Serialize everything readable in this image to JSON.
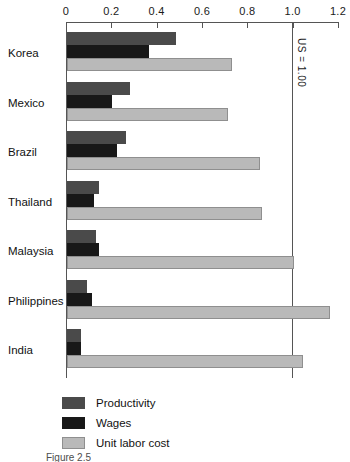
{
  "chart_data": {
    "type": "bar",
    "orientation": "horizontal",
    "title": "",
    "xlabel": "",
    "ylabel": "",
    "xlim": [
      0,
      1.2
    ],
    "grid": false,
    "legend_position": "bottom-left",
    "tick_labels": [
      "0",
      "0.2",
      "0.4",
      "0.6",
      "0.8",
      "1.0",
      "1.2"
    ],
    "tick_values": [
      0,
      0.2,
      0.4,
      0.6,
      0.8,
      1.0,
      1.2
    ],
    "categories": [
      "Korea",
      "Mexico",
      "Brazil",
      "Thailand",
      "Malaysia",
      "Philippines",
      "India"
    ],
    "series": [
      {
        "name": "Productivity",
        "color": "#4a4a4a",
        "values": [
          0.48,
          0.28,
          0.26,
          0.14,
          0.13,
          0.09,
          0.06
        ]
      },
      {
        "name": "Wages",
        "color": "#181818",
        "values": [
          0.36,
          0.2,
          0.22,
          0.12,
          0.14,
          0.11,
          0.06
        ]
      },
      {
        "name": "Unit labor cost",
        "color": "#b9b9b9",
        "values": [
          0.73,
          0.71,
          0.85,
          0.86,
          1.0,
          1.16,
          1.04
        ]
      }
    ],
    "annotations": [
      {
        "text": "US = 1.00",
        "value": 1.0,
        "orientation": "vertical"
      }
    ]
  },
  "axis": {
    "ticks": [
      "0",
      "0.2",
      "0.4",
      "0.6",
      "0.8",
      "1.0",
      "1.2"
    ]
  },
  "reference_line": {
    "label": "US = 1.00"
  },
  "countries": [
    "Korea",
    "Mexico",
    "Brazil",
    "Thailand",
    "Malaysia",
    "Philippines",
    "India"
  ],
  "legend": {
    "items": [
      {
        "label": "Productivity"
      },
      {
        "label": "Wages"
      },
      {
        "label": "Unit labor cost"
      }
    ]
  },
  "caption": {
    "text": "Figure 2.5"
  }
}
